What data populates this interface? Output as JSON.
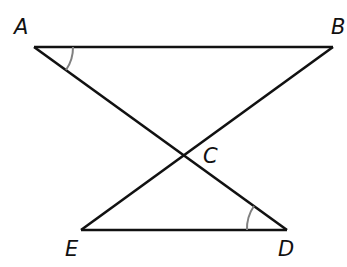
{
  "diagram": {
    "type": "geometry",
    "points": {
      "A": {
        "label": "A",
        "x": 34,
        "y": 47
      },
      "B": {
        "label": "B",
        "x": 333,
        "y": 47
      },
      "C": {
        "label": "C",
        "x": 182,
        "y": 156
      },
      "D": {
        "label": "D",
        "x": 287,
        "y": 230
      },
      "E": {
        "label": "E",
        "x": 81,
        "y": 230
      }
    },
    "segments": [
      "AB",
      "AD",
      "BE",
      "ED"
    ],
    "angle_marks": [
      {
        "vertex": "A",
        "between": [
          "B",
          "C"
        ],
        "color": "#808080"
      },
      {
        "vertex": "D",
        "between": [
          "C",
          "E"
        ],
        "color": "#808080"
      }
    ],
    "colors": {
      "line": "#111111",
      "arc": "#808080"
    }
  }
}
